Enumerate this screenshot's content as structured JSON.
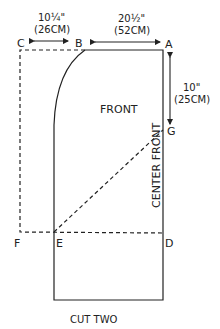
{
  "diagram": {
    "title": "CUT TWO",
    "piece_label": "FRONT",
    "fold_label": "CENTER FRONT",
    "points": {
      "A": "A",
      "B": "B",
      "C": "C",
      "D": "D",
      "E": "E",
      "F": "F",
      "G": "G"
    },
    "dimensions": {
      "cb_inches": "10¼\"",
      "cb_cm": "(26CM)",
      "ba_inches": "20½\"",
      "ba_cm": "(52CM)",
      "ag_inches": "10\"",
      "ag_cm": "(25CM)"
    },
    "colors": {
      "line": "#222222",
      "background": "#ffffff"
    }
  }
}
